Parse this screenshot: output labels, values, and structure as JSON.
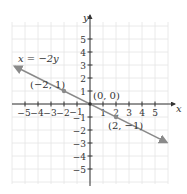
{
  "chart_data": {
    "type": "line",
    "title": "",
    "equation_label": "x = −2y",
    "xlabel": "x",
    "ylabel": "y",
    "xlim": [
      -5.8,
      6.5
    ],
    "ylim": [
      -6.2,
      6.0
    ],
    "grid": true,
    "x_ticks": [
      -5,
      -4,
      -3,
      -2,
      -1,
      1,
      2,
      3,
      4,
      5
    ],
    "y_ticks": [
      -5,
      -4,
      -3,
      -2,
      -1,
      1,
      2,
      3,
      4,
      5
    ],
    "x_tick_labels": [
      "−5",
      "−4",
      "−3",
      "−2",
      "−1",
      "1",
      "2",
      "3",
      "4",
      "5"
    ],
    "y_tick_labels": [
      "−5",
      "−4",
      "−3",
      "−2",
      "−1",
      "1",
      "2",
      "3",
      "4",
      "5"
    ],
    "series": [
      {
        "name": "x = −2y",
        "x": [
          -5.8,
          5.9
        ],
        "y": [
          2.9,
          -2.95
        ],
        "color": "#8a8a8a",
        "arrows": "both"
      }
    ],
    "points": [
      {
        "x": -2,
        "y": 1,
        "label": "(−2, 1)"
      },
      {
        "x": 0,
        "y": 0,
        "label": "(0, 0)"
      },
      {
        "x": 2,
        "y": -1,
        "label": "(2, −1)"
      }
    ],
    "colors": {
      "axis": "#333333",
      "grid": "#e4e4e4",
      "line": "#8a8a8a",
      "point": "#8a8a8a"
    }
  }
}
